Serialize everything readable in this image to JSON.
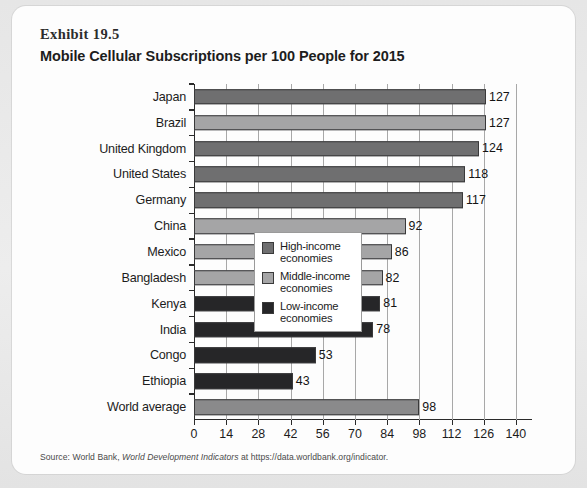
{
  "exhibit": {
    "label": "Exhibit 19.5",
    "title": "Mobile Cellular Subscriptions per 100 People for 2015"
  },
  "source": {
    "prefix": "Source: World Bank, ",
    "italic": "World Development Indicators",
    "suffix": " at https://data.worldbank.org/indicator."
  },
  "legend": {
    "items": [
      {
        "key": "high",
        "label": "High-income economies",
        "color": "#6f6f70"
      },
      {
        "key": "middle",
        "label": "Middle-income economies",
        "color": "#a5a5a6"
      },
      {
        "key": "low",
        "label": "Low-income economies",
        "color": "#262628"
      }
    ]
  },
  "chart_data": {
    "type": "bar",
    "orientation": "horizontal",
    "title": "Mobile Cellular Subscriptions per 100 People for 2015",
    "xlabel": "",
    "ylabel": "",
    "xlim": [
      0,
      147
    ],
    "xticks": [
      0,
      14,
      28,
      42,
      56,
      70,
      84,
      98,
      112,
      126,
      140
    ],
    "grid": "vertical",
    "legend_position": "inside-right-lower",
    "categories": [
      "Japan",
      "Brazil",
      "United Kingdom",
      "United States",
      "Germany",
      "China",
      "Mexico",
      "Bangladesh",
      "Kenya",
      "India",
      "Congo",
      "Ethiopia",
      "World average"
    ],
    "values": [
      127,
      127,
      124,
      118,
      117,
      92,
      86,
      82,
      81,
      78,
      53,
      43,
      98
    ],
    "groups": [
      "high",
      "middle",
      "high",
      "high",
      "high",
      "middle",
      "middle",
      "middle",
      "low",
      "low",
      "low",
      "low",
      "world"
    ],
    "group_colors": {
      "high": "#6f6f70",
      "middle": "#a5a5a6",
      "low": "#262628",
      "world": "#8a8a8b"
    }
  }
}
